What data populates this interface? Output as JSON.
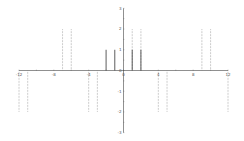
{
  "chart_data": {
    "type": "stem",
    "title": "",
    "xlabel": "",
    "ylabel": "",
    "xlim": [
      -12,
      12
    ],
    "ylim": [
      -3,
      3
    ],
    "grid": false,
    "x_ticks": [
      -12,
      -8,
      -4,
      0,
      4,
      8,
      12
    ],
    "y_ticks": [
      3,
      2,
      1,
      0,
      -1,
      -2,
      -3
    ],
    "x_tick_labels": [
      "-12",
      "-8",
      "-4",
      "0",
      "4",
      "8",
      "12"
    ],
    "y_tick_labels": [
      "3",
      "2",
      "1",
      "0",
      "-1",
      "-2",
      "-3"
    ],
    "series": [
      {
        "name": "solid stems",
        "style": "solid",
        "color": "#333333",
        "x": [
          -2,
          -1,
          1,
          2
        ],
        "values": [
          1,
          1,
          1,
          1
        ]
      },
      {
        "name": "dotted stems",
        "style": "dotted",
        "color": "#888888",
        "x": [
          -12,
          -11,
          -7,
          -6,
          -4,
          -3,
          1,
          2,
          4,
          5,
          9,
          10,
          12
        ],
        "values": [
          -2,
          -2,
          2,
          2,
          -2,
          -2,
          2,
          2,
          -2,
          -2,
          2,
          2,
          -2
        ]
      }
    ]
  },
  "colors": {
    "axis": "#444444",
    "solid_stem": "#333333",
    "dotted_stem": "#888888",
    "label": "#555555"
  }
}
